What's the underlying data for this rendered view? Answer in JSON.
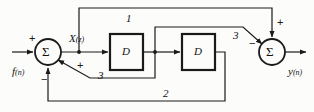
{
  "diagram": {
    "blocks": [
      {
        "id": "delay-1",
        "label": "D",
        "x": 110,
        "y": 34,
        "w": 33,
        "h": 36
      },
      {
        "id": "delay-2",
        "label": "D",
        "x": 182,
        "y": 34,
        "w": 33,
        "h": 36
      }
    ],
    "summers": [
      {
        "id": "summer-left",
        "label": "Σ",
        "cx": 48,
        "cy": 52,
        "r": 13
      },
      {
        "id": "summer-right",
        "label": "Σ",
        "cx": 272,
        "cy": 52,
        "r": 13
      }
    ],
    "signals": {
      "input": "f(n)",
      "input_base": "f",
      "input_arg": "(n)",
      "intermediate": "X(z)",
      "intermediate_base": "X",
      "intermediate_arg": "(z)",
      "output": "y(n)",
      "output_base": "y",
      "output_arg": "(n)"
    },
    "gain_labels": {
      "feedforward_top": "1",
      "feedback_bottom": "2",
      "forward_branch": "3",
      "feedback_branch": "3"
    },
    "signs": {
      "summer_left_input": "+",
      "summer_left_branch": "+",
      "summer_left_feedback": "−",
      "summer_right_top": "+",
      "summer_right_branch": "−"
    },
    "colors": {
      "line": "#1a1a1a",
      "text": "#111111",
      "background": "#fcfcfa"
    }
  }
}
